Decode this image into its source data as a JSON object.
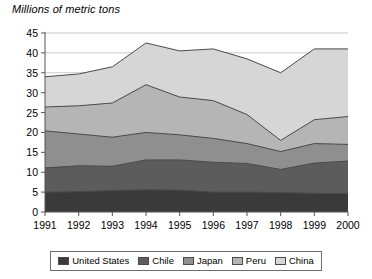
{
  "axis_title": "Millions of metric tons",
  "legend": {
    "entries": [
      {
        "label": "United States",
        "color": "#3a3a3a"
      },
      {
        "label": "Chile",
        "color": "#5c5c5c"
      },
      {
        "label": "Japan",
        "color": "#8f8f8f"
      },
      {
        "label": "Peru",
        "color": "#b5b5b5"
      },
      {
        "label": "China",
        "color": "#d6d6d6"
      }
    ]
  },
  "chart_data": {
    "type": "area",
    "stacked": true,
    "title": "",
    "subtitle": "",
    "xlabel": "",
    "ylabel": "Millions of metric tons",
    "ylim": [
      0,
      45
    ],
    "ytick_step": 5,
    "yticks": [
      0,
      5,
      10,
      15,
      20,
      25,
      30,
      35,
      40,
      45
    ],
    "grid": true,
    "legend_position": "bottom",
    "categories": [
      "1991",
      "1992",
      "1993",
      "1994",
      "1995",
      "1996",
      "1997",
      "1998",
      "1999",
      "2000"
    ],
    "x": [
      1991,
      1992,
      1993,
      1994,
      1995,
      1996,
      1997,
      1998,
      1999,
      2000
    ],
    "series": [
      {
        "name": "United States",
        "color": "#3a3a3a",
        "values": [
          5.0,
          5.1,
          5.4,
          5.6,
          5.5,
          5.0,
          5.0,
          4.9,
          4.7,
          4.7
        ]
      },
      {
        "name": "Chile",
        "color": "#5c5c5c",
        "values": [
          6.1,
          6.5,
          6.1,
          7.5,
          7.6,
          7.5,
          7.2,
          5.8,
          7.6,
          8.1
        ]
      },
      {
        "name": "Japan",
        "color": "#8f8f8f",
        "values": [
          9.3,
          8.0,
          7.3,
          6.9,
          6.3,
          6.0,
          5.0,
          4.5,
          4.9,
          4.2
        ]
      },
      {
        "name": "Peru",
        "color": "#b5b5b5",
        "values": [
          6.0,
          7.1,
          8.6,
          12.0,
          9.5,
          9.5,
          7.3,
          2.8,
          6.0,
          7.0
        ]
      },
      {
        "name": "China",
        "color": "#d6d6d6",
        "values": [
          7.6,
          8.0,
          9.1,
          10.5,
          11.6,
          13.0,
          14.0,
          17.0,
          17.8,
          17.0
        ]
      }
    ],
    "totals": [
      34.0,
      34.7,
      36.5,
      42.5,
      40.5,
      41.0,
      38.5,
      35.0,
      41.0,
      41.0
    ]
  }
}
